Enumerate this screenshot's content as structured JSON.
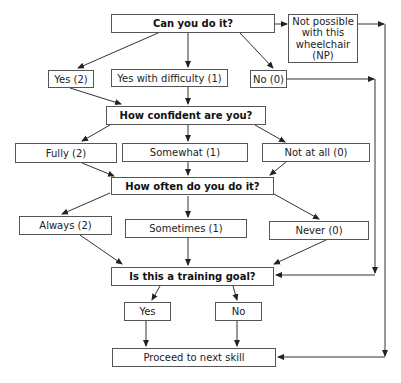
{
  "diagram": {
    "type": "flowchart",
    "colors": {
      "line": "#333333",
      "border": "#555555",
      "background": "#ffffff",
      "text": "#222222"
    },
    "nodes": {
      "q1": {
        "label": "Can you do it?",
        "kind": "question"
      },
      "np": {
        "label": "Not possible with this wheelchair (NP)",
        "kind": "answer"
      },
      "yes2": {
        "label": "Yes (2)",
        "kind": "answer"
      },
      "yes_diff": {
        "label": "Yes with difficulty (1)",
        "kind": "answer"
      },
      "no0": {
        "label": "No (0)",
        "kind": "answer"
      },
      "q2": {
        "label": "How confident are you?",
        "kind": "question"
      },
      "fully": {
        "label": "Fully (2)",
        "kind": "answer"
      },
      "somewhat": {
        "label": "Somewhat (1)",
        "kind": "answer"
      },
      "notatall": {
        "label": "Not at all (0)",
        "kind": "answer"
      },
      "q3": {
        "label": "How often do you do it?",
        "kind": "question"
      },
      "always": {
        "label": "Always (2)",
        "kind": "answer"
      },
      "sometimes": {
        "label": "Sometimes (1)",
        "kind": "answer"
      },
      "never": {
        "label": "Never (0)",
        "kind": "answer"
      },
      "q4": {
        "label": "Is this a training goal?",
        "kind": "question"
      },
      "yes": {
        "label": "Yes",
        "kind": "answer"
      },
      "no": {
        "label": "No",
        "kind": "answer"
      },
      "proceed": {
        "label": "Proceed to next skill",
        "kind": "terminal"
      }
    },
    "edges": [
      [
        "q1",
        "yes2"
      ],
      [
        "q1",
        "yes_diff"
      ],
      [
        "q1",
        "no0"
      ],
      [
        "q1",
        "np"
      ],
      [
        "yes2",
        "q2"
      ],
      [
        "yes_diff",
        "q2"
      ],
      [
        "no0",
        "q4"
      ],
      [
        "np",
        "proceed"
      ],
      [
        "q2",
        "fully"
      ],
      [
        "q2",
        "somewhat"
      ],
      [
        "q2",
        "notatall"
      ],
      [
        "fully",
        "q3"
      ],
      [
        "somewhat",
        "q3"
      ],
      [
        "notatall",
        "q3"
      ],
      [
        "q3",
        "always"
      ],
      [
        "q3",
        "sometimes"
      ],
      [
        "q3",
        "never"
      ],
      [
        "always",
        "q4"
      ],
      [
        "sometimes",
        "q4"
      ],
      [
        "never",
        "q4"
      ],
      [
        "q4",
        "yes"
      ],
      [
        "q4",
        "no"
      ],
      [
        "yes",
        "proceed"
      ],
      [
        "no",
        "proceed"
      ]
    ]
  }
}
